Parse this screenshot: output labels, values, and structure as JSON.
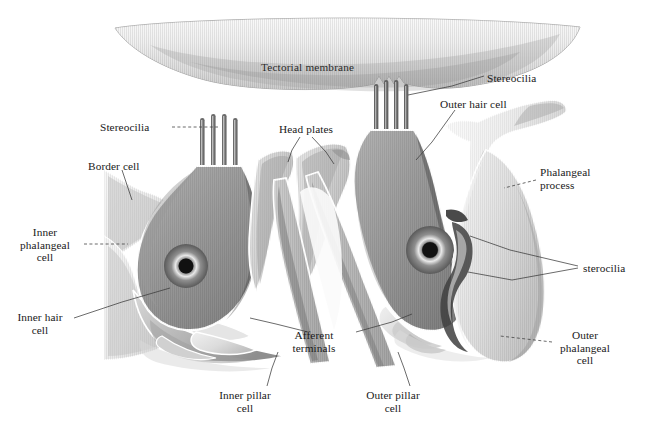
{
  "figure": {
    "background_color": "#ffffff",
    "ink_color": "#1a1a1a",
    "width": 653,
    "height": 438
  },
  "palette": {
    "hair_cell_dark": "#6a6a6a",
    "hair_cell_darker": "#4f4f4f",
    "supporting_mid": "#9a9a9a",
    "supporting_light": "#c9c9c9",
    "supporting_pale": "#e2e2e2",
    "membrane_light": "#d8d8d8",
    "membrane_shadow": "#9b9b9b",
    "nucleus": "#141414",
    "outline": "#ffffff",
    "leader_line": "#3a3a3a"
  },
  "labels": [
    {
      "id": "tectorial-membrane",
      "text": "Tectorial membrane",
      "x": 261,
      "y": 61,
      "align": "left",
      "leader": false
    },
    {
      "id": "stereocilia-right-top",
      "text": "Stereocilia",
      "x": 487,
      "y": 73,
      "align": "left",
      "leader": true
    },
    {
      "id": "outer-hair-cell",
      "text": "Outer hair cell",
      "x": 440,
      "y": 99,
      "align": "left",
      "leader": true
    },
    {
      "id": "stereocilia-left",
      "text": "Stereocilia",
      "x": 100,
      "y": 121,
      "align": "left",
      "leader": true
    },
    {
      "id": "head-plates",
      "text": "Head plates",
      "x": 279,
      "y": 123,
      "align": "left",
      "leader": true
    },
    {
      "id": "border-cell",
      "text": "Border cell",
      "x": 88,
      "y": 160,
      "align": "left",
      "leader": true
    },
    {
      "id": "phalangeal-process",
      "text": "Phalangeal\nprocess",
      "x": 540,
      "y": 166,
      "align": "left",
      "leader": true
    },
    {
      "id": "inner-phalangeal-cell",
      "text": "Inner\nphalangeal\ncell",
      "x": 33,
      "y": 226,
      "align": "center",
      "leader": true
    },
    {
      "id": "sterocilia-right-lower",
      "text": "sterocilia",
      "x": 583,
      "y": 262,
      "align": "left",
      "leader": true
    },
    {
      "id": "inner-hair-cell",
      "text": "Inner hair\ncell",
      "x": 30,
      "y": 311,
      "align": "center",
      "leader": true
    },
    {
      "id": "afferent-terminals",
      "text": "Afferent\nterminals",
      "x": 313,
      "y": 329,
      "align": "center",
      "leader": true
    },
    {
      "id": "outer-phalangeal-cell",
      "text": "Outer\nphalangeal\ncell",
      "x": 584,
      "y": 329,
      "align": "center",
      "leader": true
    },
    {
      "id": "inner-pillar-cell",
      "text": "Inner pillar\ncell",
      "x": 243,
      "y": 389,
      "align": "center",
      "leader": true
    },
    {
      "id": "outer-pillar-cell",
      "text": "Outer pillar\ncell",
      "x": 392,
      "y": 389,
      "align": "center",
      "leader": true
    }
  ],
  "structures": [
    {
      "id": "tectorial-membrane-body",
      "name": "Tectorial membrane",
      "shading": "striated lens shape"
    },
    {
      "id": "inner-hair-cell-body",
      "name": "Inner hair cell",
      "stereocilia_count": 4
    },
    {
      "id": "outer-hair-cell-body",
      "name": "Outer hair cell",
      "stereocilia_count": 4
    },
    {
      "id": "inner-pillar-cell-body",
      "name": "Inner pillar cell"
    },
    {
      "id": "outer-pillar-cell-body",
      "name": "Outer pillar cell"
    },
    {
      "id": "border-cell-body",
      "name": "Border cell"
    },
    {
      "id": "inner-phalangeal-cell-body",
      "name": "Inner phalangeal cell"
    },
    {
      "id": "outer-phalangeal-cell-body",
      "name": "Outer phalangeal cell"
    },
    {
      "id": "phalangeal-process-body",
      "name": "Phalangeal process"
    },
    {
      "id": "head-plate-inner",
      "name": "Head plate (inner pillar)"
    },
    {
      "id": "head-plate-outer",
      "name": "Head plate (outer pillar)"
    },
    {
      "id": "afferent-terminals-body",
      "name": "Afferent terminals"
    }
  ]
}
